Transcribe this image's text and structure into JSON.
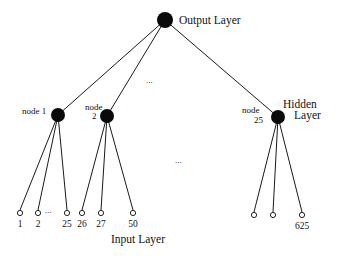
{
  "diagram": {
    "output_layer": {
      "label": "Output Layer",
      "node": {
        "cx": 165,
        "cy": 20,
        "r": 8
      }
    },
    "hidden_layer": {
      "label_line1": "Hidden",
      "label_line2": "Layer",
      "nodes": [
        {
          "id": "node1",
          "label_line1": "node 1",
          "label_line2": "",
          "cx": 58,
          "cy": 115,
          "r": 7
        },
        {
          "id": "node2",
          "label_line1": "node",
          "label_line2": "2",
          "cx": 107,
          "cy": 116,
          "r": 7
        },
        {
          "id": "node25",
          "label_line1": "node",
          "label_line2": "25",
          "cx": 278,
          "cy": 117,
          "r": 7
        }
      ],
      "ellipsis": "..."
    },
    "input_layer": {
      "label": "Input Layer",
      "nodes": [
        {
          "label": "1",
          "cx": 20,
          "cy": 213,
          "parent": "node1"
        },
        {
          "label": "2",
          "cx": 38,
          "cy": 213,
          "parent": "node1"
        },
        {
          "label": "25",
          "cx": 67,
          "cy": 213,
          "parent": "node1"
        },
        {
          "label": "26",
          "cx": 82,
          "cy": 213,
          "parent": "node2"
        },
        {
          "label": "27",
          "cx": 101,
          "cy": 213,
          "parent": "node2"
        },
        {
          "label": "50",
          "cx": 133,
          "cy": 213,
          "parent": "node2"
        },
        {
          "label": "",
          "cx": 254,
          "cy": 215,
          "parent": "node25"
        },
        {
          "label": "",
          "cx": 273,
          "cy": 215,
          "parent": "node25"
        },
        {
          "label": "625",
          "cx": 302,
          "cy": 215,
          "parent": "node25"
        }
      ],
      "ellipsis_between_inputs": "...",
      "ellipsis_middle": "..."
    }
  }
}
